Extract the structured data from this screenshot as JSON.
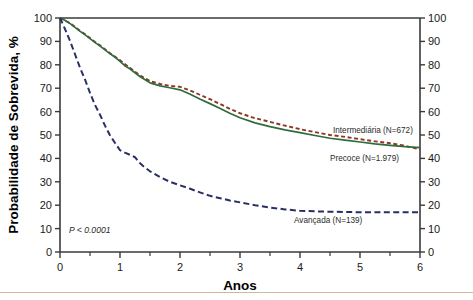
{
  "figure": {
    "name": "survival-curve-figure",
    "background": "#ffffff",
    "rule_color": "#c9bc9c"
  },
  "axes": {
    "x_title": "Anos",
    "y_title": "Probabilidade de Sobrevida, %",
    "x_ticks": [
      "0",
      "1",
      "2",
      "3",
      "4",
      "5",
      "6"
    ],
    "y_ticks_left": [
      "0",
      "10",
      "20",
      "30",
      "40",
      "50",
      "60",
      "70",
      "80",
      "90",
      "100"
    ],
    "y_ticks_right": [
      "0",
      "10",
      "20",
      "30",
      "40",
      "50",
      "60",
      "70",
      "80",
      "90",
      "100"
    ]
  },
  "annotations": {
    "p_value": "P < 0.0001",
    "label_intermediaria": "Intermediária (N=672)",
    "label_precoce": "Precoce (N=1.979)",
    "label_avancada": "Avançada (N=139)"
  },
  "chart_data": {
    "type": "line",
    "title": "",
    "subtitle": "",
    "xlabel": "Anos",
    "ylabel": "Probabilidade de Sobrevida, %",
    "xlim": [
      0,
      6
    ],
    "ylim": [
      0,
      100
    ],
    "xticks": [
      0,
      1,
      2,
      3,
      4,
      5,
      6
    ],
    "xticks_minor_step": 0.5,
    "yticks": [
      0,
      10,
      20,
      30,
      40,
      50,
      60,
      70,
      80,
      90,
      100
    ],
    "grid": false,
    "legend": "inline-annotations",
    "dual_y_axis": true,
    "annotation_p_value": "P < 0.0001",
    "series": [
      {
        "name": "Intermediária (N=672)",
        "n": 672,
        "color": "#8c3626",
        "style": "dashed",
        "dasharray": "4,2.6",
        "width": 1.9,
        "label_x": 4.55,
        "label_y": 51,
        "x": [
          0,
          0.08,
          0.17,
          0.25,
          0.33,
          0.42,
          0.5,
          0.58,
          0.67,
          0.75,
          0.83,
          0.92,
          1.0,
          1.08,
          1.17,
          1.25,
          1.33,
          1.42,
          1.5,
          1.67,
          1.83,
          2.0,
          2.17,
          2.33,
          2.5,
          2.67,
          2.83,
          3.0,
          3.25,
          3.5,
          3.75,
          4.0,
          4.25,
          4.5,
          4.75,
          5.0,
          5.25,
          5.5,
          5.75,
          6.0
        ],
        "y": [
          100,
          99.0,
          97.7,
          96.2,
          94.6,
          93.0,
          91.4,
          89.8,
          88.2,
          86.6,
          85.0,
          83.4,
          82.0,
          80.3,
          78.6,
          77.0,
          75.5,
          74.2,
          73.0,
          71.8,
          71.0,
          70.6,
          69.0,
          67.2,
          65.3,
          63.2,
          61.2,
          59.3,
          57.2,
          55.6,
          54.0,
          52.5,
          51.2,
          50.0,
          49.2,
          48.2,
          47.3,
          46.5,
          45.4,
          43.8
        ]
      },
      {
        "name": "Precoce (N=1.979)",
        "n": 1979,
        "color": "#2f6b3c",
        "style": "solid",
        "dasharray": "none",
        "width": 1.7,
        "label_x": 4.5,
        "label_y": 39,
        "x": [
          0,
          0.08,
          0.17,
          0.25,
          0.33,
          0.42,
          0.5,
          0.58,
          0.67,
          0.75,
          0.83,
          0.92,
          1.0,
          1.08,
          1.17,
          1.25,
          1.33,
          1.42,
          1.5,
          1.67,
          1.83,
          2.0,
          2.17,
          2.33,
          2.5,
          2.67,
          2.83,
          3.0,
          3.25,
          3.5,
          3.75,
          4.0,
          4.25,
          4.5,
          4.75,
          5.0,
          5.25,
          5.5,
          5.75,
          6.0
        ],
        "y": [
          100,
          99.0,
          97.6,
          96.0,
          94.4,
          92.8,
          91.2,
          89.6,
          88.0,
          86.4,
          84.8,
          83.2,
          81.5,
          79.6,
          78.2,
          76.6,
          75.0,
          73.6,
          72.3,
          71.0,
          70.2,
          69.3,
          67.4,
          65.4,
          63.4,
          61.3,
          59.3,
          57.4,
          55.2,
          53.6,
          52.2,
          51.0,
          49.8,
          48.6,
          47.8,
          47.0,
          46.2,
          45.6,
          45.0,
          44.6
        ]
      },
      {
        "name": "Avançada (N=139)",
        "n": 139,
        "color": "#2a2f63",
        "style": "dashed",
        "dasharray": "6,3.4",
        "width": 2.0,
        "label_x": 3.9,
        "label_y": 12.5,
        "x": [
          0,
          0.08,
          0.17,
          0.25,
          0.33,
          0.42,
          0.5,
          0.58,
          0.67,
          0.75,
          0.83,
          0.92,
          1.0,
          1.08,
          1.17,
          1.25,
          1.33,
          1.42,
          1.5,
          1.67,
          1.83,
          2.0,
          2.17,
          2.33,
          2.5,
          2.67,
          2.83,
          3.0,
          3.25,
          3.5,
          3.75,
          4.0,
          4.5,
          5.0,
          5.5,
          6.0
        ],
        "y": [
          100,
          95.5,
          90.0,
          84.5,
          79.0,
          73.5,
          68.0,
          63.0,
          58.5,
          54.0,
          50.0,
          46.5,
          43.5,
          42.5,
          41.5,
          40.5,
          38.0,
          36.0,
          34.5,
          32.0,
          30.0,
          28.5,
          27.0,
          25.5,
          24.0,
          23.0,
          22.0,
          21.2,
          20.0,
          19.0,
          18.2,
          17.6,
          17.2,
          17.0,
          17.0,
          17.0
        ]
      }
    ]
  }
}
